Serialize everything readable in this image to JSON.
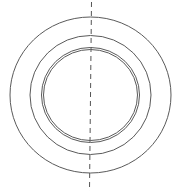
{
  "diagram": {
    "type": "concentric-circles-technical-drawing",
    "canvas": {
      "width": 177,
      "height": 193
    },
    "colors": {
      "background": "#ffffff",
      "line": "#5a5a5a",
      "centerline": "#555555"
    },
    "center": {
      "x": 90.5,
      "y": 95
    },
    "rings": [
      {
        "name": "outer-ring",
        "rx": 80.5,
        "ry": 78
      },
      {
        "name": "middle-ring",
        "rx": 60.5,
        "ry": 59.5
      },
      {
        "name": "inner-ring-outer-line",
        "rx": 49,
        "ry": 47.5
      },
      {
        "name": "inner-ring-inner-line",
        "rx": 47,
        "ry": 45.5
      }
    ],
    "centerline": {
      "orientation": "vertical",
      "style": "dashed",
      "x1": 91.5,
      "y1": 2,
      "x2": 89.5,
      "y2": 191,
      "dash": "5,4"
    }
  }
}
